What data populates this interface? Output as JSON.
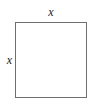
{
  "figure": {
    "kind": "geometry-diagram",
    "shape": "square",
    "width_px": 95,
    "height_px": 108,
    "background_color": "#ffffff",
    "stroke_color": "#6f6f6f",
    "fill_color": "#ffffff",
    "label_color": "#1a1a1a",
    "labels": {
      "top_side": "x",
      "left_side": "x"
    }
  }
}
